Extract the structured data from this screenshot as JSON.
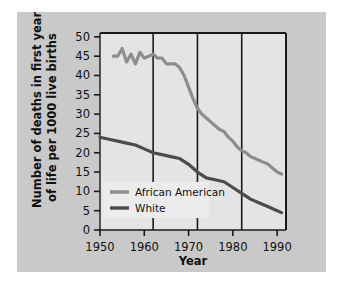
{
  "chart_data": {
    "type": "line",
    "title": "",
    "xlabel": "Year",
    "ylabel": "Number of deaths in first year of life per 1000 live births",
    "ylabel_line1": "Number of deaths in first year",
    "ylabel_line2": "of life per 1000 live births",
    "xlim": [
      1950,
      1992
    ],
    "ylim": [
      0,
      51
    ],
    "xticks": [
      1950,
      1960,
      1970,
      1980,
      1990
    ],
    "xticklabels": [
      "1950",
      "1960",
      "1970",
      "1980",
      "1990"
    ],
    "yticks": [
      0,
      5,
      10,
      15,
      20,
      25,
      30,
      35,
      40,
      45,
      50
    ],
    "yticklabels": [
      "0",
      "5",
      "10",
      "15",
      "20",
      "25",
      "30",
      "35",
      "40",
      "45",
      "50"
    ],
    "grid": "vertical-only",
    "gridlines_x": [
      1962,
      1972,
      1982
    ],
    "legend_position": "lower-left-inside",
    "plot_background": "#e4e4e4",
    "figure_background": "#c9c9c9",
    "series": [
      {
        "name": "African American",
        "color": "#8d8d8d",
        "x": [
          1953,
          1954,
          1955,
          1956,
          1957,
          1958,
          1959,
          1960,
          1961,
          1962,
          1963,
          1964,
          1965,
          1966,
          1967,
          1968,
          1969,
          1970,
          1971,
          1972,
          1973,
          1974,
          1975,
          1976,
          1977,
          1978,
          1979,
          1980,
          1981,
          1982,
          1983,
          1984,
          1985,
          1986,
          1987,
          1988,
          1989,
          1990,
          1991
        ],
        "values": [
          45.0,
          45.0,
          47.0,
          43.5,
          45.5,
          43.0,
          46.0,
          44.5,
          45.0,
          45.5,
          44.5,
          44.5,
          43.0,
          43.0,
          43.0,
          42.0,
          40.0,
          37.0,
          34.0,
          31.5,
          30.0,
          29.0,
          28.0,
          27.0,
          26.0,
          25.5,
          24.0,
          23.0,
          21.5,
          20.5,
          20.0,
          19.0,
          18.5,
          18.0,
          17.5,
          17.0,
          16.0,
          15.0,
          14.5
        ]
      },
      {
        "name": "White",
        "color": "#4c4c4c",
        "x": [
          1950,
          1952,
          1954,
          1956,
          1958,
          1960,
          1962,
          1964,
          1966,
          1968,
          1970,
          1972,
          1974,
          1976,
          1978,
          1980,
          1982,
          1984,
          1986,
          1988,
          1990,
          1991
        ],
        "values": [
          24.0,
          23.5,
          23.0,
          22.5,
          22.0,
          21.0,
          20.0,
          19.5,
          19.0,
          18.5,
          17.0,
          15.0,
          13.5,
          13.0,
          12.5,
          11.0,
          9.5,
          8.0,
          7.0,
          6.0,
          5.0,
          4.5
        ]
      }
    ],
    "legend_items": [
      {
        "label": "African American",
        "color": "#8d8d8d"
      },
      {
        "label": "White",
        "color": "#4c4c4c"
      }
    ]
  }
}
